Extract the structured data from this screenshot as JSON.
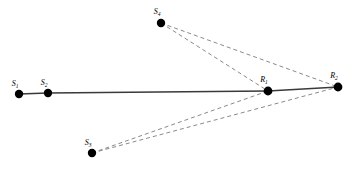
{
  "figure": {
    "title": "",
    "background_color": "#ffffff",
    "width": 356,
    "height": 169
  },
  "style": {
    "solid_edge_color": "#3a3a3a",
    "dashed_edge_color": "#8a8a8a",
    "node_color": "#000000",
    "label_color": "#000000"
  },
  "nodes": [
    {
      "id": "S1",
      "base": "S",
      "subscript": "1",
      "label": "S1",
      "x": 19,
      "y": 94,
      "r": 4.2,
      "label_x": 15,
      "label_y": 86
    },
    {
      "id": "S2",
      "base": "S",
      "subscript": "2",
      "label": "S2",
      "x": 48,
      "y": 93,
      "r": 4.2,
      "label_x": 44,
      "label_y": 85
    },
    {
      "id": "S3",
      "base": "S",
      "subscript": "3",
      "label": "S3",
      "x": 92,
      "y": 153,
      "r": 4.2,
      "label_x": 88,
      "label_y": 145
    },
    {
      "id": "S4",
      "base": "S",
      "subscript": "4",
      "label": "S4",
      "x": 161,
      "y": 23,
      "r": 4.2,
      "label_x": 157,
      "label_y": 14
    },
    {
      "id": "R1",
      "base": "R",
      "subscript": "1",
      "label": "R1",
      "x": 268,
      "y": 91,
      "r": 4.4,
      "label_x": 264,
      "label_y": 82
    },
    {
      "id": "R2",
      "base": "R",
      "subscript": "2",
      "label": "R2",
      "x": 338,
      "y": 87,
      "r": 4.4,
      "label_x": 334,
      "label_y": 78
    }
  ],
  "edges": [
    {
      "id": "edge-s1-s2",
      "from": "S1",
      "to": "S2",
      "style": "solid"
    },
    {
      "id": "edge-s2-r1",
      "from": "S2",
      "to": "R1",
      "style": "solid"
    },
    {
      "id": "edge-r1-r2",
      "from": "R1",
      "to": "R2",
      "style": "solid"
    },
    {
      "id": "edge-s3-r1",
      "from": "S3",
      "to": "R1",
      "style": "dashed"
    },
    {
      "id": "edge-s3-r2",
      "from": "S3",
      "to": "R2",
      "style": "dashed"
    },
    {
      "id": "edge-s4-r1",
      "from": "S4",
      "to": "R1",
      "style": "dashed"
    },
    {
      "id": "edge-s4-r2",
      "from": "S4",
      "to": "R2",
      "style": "dashed"
    }
  ]
}
